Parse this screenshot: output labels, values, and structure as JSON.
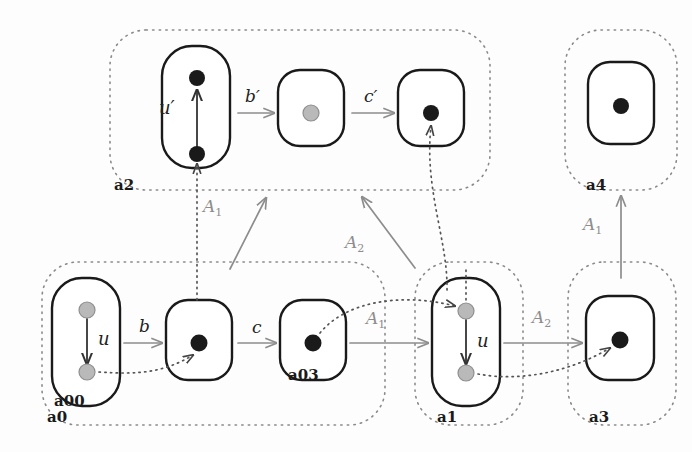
{
  "diagram": {
    "type": "commutative-diagram",
    "colors": {
      "black_node": "#1a1a1a",
      "gray_node": "#b3b3b3",
      "solid_arrow": "#8d8d8d",
      "dotted_arrow": "#555555",
      "group_border": "#8a8a8a",
      "object_border": "#1a1a1a",
      "nat_label": "#8d8d8d",
      "morphism_label": "#222222"
    },
    "groups": [
      {
        "id": "a2",
        "label": "a2",
        "x": 110,
        "y": 30,
        "w": 380,
        "h": 160
      },
      {
        "id": "a4",
        "label": "a4",
        "x": 565,
        "y": 30,
        "w": 112,
        "h": 160
      },
      {
        "id": "a0",
        "label": "a0",
        "x": 42,
        "y": 262,
        "w": 343,
        "h": 163
      },
      {
        "id": "a1",
        "label": "a1",
        "x": 415,
        "y": 262,
        "w": 108,
        "h": 163
      },
      {
        "id": "a3",
        "label": "a3",
        "x": 568,
        "y": 262,
        "w": 108,
        "h": 163
      }
    ],
    "objects": [
      {
        "id": "a2u",
        "label": "a00",
        "show_label": false,
        "x": 162,
        "y": 46,
        "w": 68,
        "h": 122,
        "rx": 30
      },
      {
        "id": "a2m",
        "label": "",
        "show_label": false,
        "x": 278,
        "y": 70,
        "w": 66,
        "h": 76,
        "rx": 22
      },
      {
        "id": "a2r",
        "label": "",
        "show_label": false,
        "x": 398,
        "y": 70,
        "w": 66,
        "h": 76,
        "rx": 22
      },
      {
        "id": "a4b",
        "label": "",
        "show_label": false,
        "x": 588,
        "y": 62,
        "w": 66,
        "h": 82,
        "rx": 22
      },
      {
        "id": "a00",
        "label": "a00",
        "show_label": true,
        "x": 52,
        "y": 278,
        "w": 68,
        "h": 128,
        "rx": 30
      },
      {
        "id": "a02",
        "label": "",
        "show_label": false,
        "x": 166,
        "y": 300,
        "w": 66,
        "h": 80,
        "rx": 22
      },
      {
        "id": "a03",
        "label": "a03",
        "show_label": true,
        "x": 280,
        "y": 300,
        "w": 66,
        "h": 80,
        "rx": 22
      },
      {
        "id": "a1b",
        "label": "",
        "show_label": false,
        "x": 432,
        "y": 278,
        "w": 68,
        "h": 128,
        "rx": 30
      },
      {
        "id": "a3b",
        "label": "",
        "show_label": false,
        "x": 586,
        "y": 296,
        "w": 68,
        "h": 84,
        "rx": 22
      }
    ],
    "nodes": [
      {
        "id": "n1",
        "cx": 197,
        "cy": 78,
        "fill": "black",
        "r": 8
      },
      {
        "id": "n2",
        "cx": 197,
        "cy": 154,
        "fill": "black",
        "r": 8
      },
      {
        "id": "n3",
        "cx": 311,
        "cy": 113,
        "fill": "gray",
        "r": 8
      },
      {
        "id": "n4",
        "cx": 431,
        "cy": 113,
        "fill": "black",
        "r": 8
      },
      {
        "id": "n5",
        "cx": 621,
        "cy": 106,
        "fill": "black",
        "r": 8
      },
      {
        "id": "n6",
        "cx": 87,
        "cy": 310,
        "fill": "gray",
        "r": 8
      },
      {
        "id": "n7",
        "cx": 87,
        "cy": 372,
        "fill": "gray",
        "r": 8
      },
      {
        "id": "n8",
        "cx": 199,
        "cy": 343,
        "fill": "black",
        "r": 9
      },
      {
        "id": "n9",
        "cx": 313,
        "cy": 343,
        "fill": "black",
        "r": 9
      },
      {
        "id": "n10",
        "cx": 466,
        "cy": 311,
        "fill": "gray",
        "r": 8
      },
      {
        "id": "n11",
        "cx": 466,
        "cy": 373,
        "fill": "gray",
        "r": 8
      },
      {
        "id": "n12",
        "cx": 620,
        "cy": 340,
        "fill": "black",
        "r": 9
      }
    ],
    "morphism_labels": [
      {
        "id": "u-prime",
        "text": "u′",
        "x": 159,
        "y": 97,
        "style": "mor-lbl-up"
      },
      {
        "id": "b-prime",
        "text": "b′",
        "x": 245,
        "y": 86,
        "style": "mor-lbl"
      },
      {
        "id": "c-prime",
        "text": "c′",
        "x": 364,
        "y": 86,
        "style": "mor-lbl"
      },
      {
        "id": "u-a00",
        "text": "u",
        "x": 98,
        "y": 328,
        "style": "mor-lbl-up"
      },
      {
        "id": "b",
        "text": "b",
        "x": 139,
        "y": 316,
        "style": "mor-lbl"
      },
      {
        "id": "c",
        "text": "c",
        "x": 252,
        "y": 317,
        "style": "mor-lbl"
      },
      {
        "id": "u-a1",
        "text": "u",
        "x": 477,
        "y": 330,
        "style": "mor-lbl-up"
      }
    ],
    "nat_labels": [
      {
        "id": "A1-diag",
        "text": "A",
        "sub": "1",
        "x": 203,
        "y": 196
      },
      {
        "id": "A2-diag",
        "text": "A",
        "sub": "2",
        "x": 345,
        "y": 232
      },
      {
        "id": "A1-mid",
        "text": "A",
        "sub": "1",
        "x": 366,
        "y": 308
      },
      {
        "id": "A2-mid",
        "text": "A",
        "sub": "2",
        "x": 532,
        "y": 307
      },
      {
        "id": "A1-right",
        "text": "A",
        "sub": "1",
        "x": 583,
        "y": 214
      }
    ],
    "solid_arrows": [
      {
        "id": "arrow-u-prime",
        "from": [
          197,
          147
        ],
        "to": [
          197,
          90
        ],
        "desc": "u-prime upward"
      },
      {
        "id": "arrow-b-prime",
        "from": [
          238,
          113
        ],
        "to": [
          274,
          113
        ],
        "desc": "b-prime"
      },
      {
        "id": "arrow-c-prime",
        "from": [
          352,
          113
        ],
        "to": [
          394,
          113
        ],
        "desc": "c-prime"
      },
      {
        "id": "arrow-u-a00",
        "from": [
          87,
          319
        ],
        "to": [
          87,
          364
        ],
        "desc": "u downward in a00"
      },
      {
        "id": "arrow-b",
        "from": [
          124,
          343
        ],
        "to": [
          162,
          343
        ],
        "desc": "b"
      },
      {
        "id": "arrow-c",
        "from": [
          238,
          343
        ],
        "to": [
          276,
          343
        ],
        "desc": "c"
      },
      {
        "id": "arrow-A1-mid",
        "from": [
          350,
          343
        ],
        "to": [
          428,
          343
        ],
        "desc": "A1 a03 to a1"
      },
      {
        "id": "arrow-u-a1",
        "from": [
          466,
          320
        ],
        "to": [
          466,
          364
        ],
        "desc": "u downward in a1"
      },
      {
        "id": "arrow-A2-mid",
        "from": [
          504,
          343
        ],
        "to": [
          582,
          343
        ],
        "desc": "A2 a1 to a3"
      },
      {
        "id": "arrow-A1-right",
        "from": [
          621,
          278
        ],
        "to": [
          621,
          196
        ],
        "desc": "A1 a3 to a4"
      },
      {
        "id": "arrow-A1-diag",
        "from": [
          230,
          269
        ],
        "to": [
          264,
          198
        ],
        "desc": "A1 diagonal to a2"
      },
      {
        "id": "arrow-A2-diag",
        "from": [
          415,
          268
        ],
        "to": [
          363,
          197
        ],
        "desc": "A2 diagonal to a2"
      }
    ],
    "dotted_arrows": [
      {
        "id": "dot-a00-to-a2u",
        "desc": "a00 bottom dot up to a2 lower node"
      },
      {
        "id": "dot-a00-to-a02",
        "desc": "a00 gray lower dot to a02 black dot"
      },
      {
        "id": "dot-a03-to-a1",
        "desc": "a03 black dot to a1 upper gray dot"
      },
      {
        "id": "dot-a1-to-a2r",
        "desc": "a1 up to c-prime box black dot"
      },
      {
        "id": "dot-a1-to-a3",
        "desc": "a1 lower gray dot to a3 black dot"
      }
    ]
  }
}
